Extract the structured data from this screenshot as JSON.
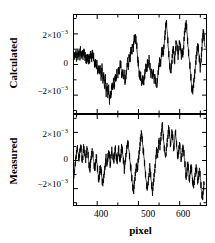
{
  "figure": {
    "background": "#ffffff",
    "foreground": "#000000",
    "xlabel": "pixel",
    "panels": [
      {
        "id": "calculated",
        "ylabel": "Calculated"
      },
      {
        "id": "measured",
        "ylabel": "Measured"
      }
    ],
    "ytick_labels": [
      "2×10",
      "0",
      "−2×10"
    ],
    "ytick_exponent": "−3",
    "xtick_labels": [
      "400",
      "500",
      "600"
    ]
  },
  "chart_data": {
    "type": "line",
    "title": "",
    "subtitle": "",
    "xlabel": "pixel",
    "ylabel": "",
    "grid": false,
    "legend": null,
    "xlim": [
      345,
      665
    ],
    "xticks": [
      400,
      500,
      600
    ],
    "xticks_minor": [
      350,
      450,
      550,
      650
    ],
    "xtick_labels": [
      "400",
      "500",
      "600"
    ],
    "shared_x": true,
    "panels": [
      {
        "name": "Calculated",
        "ylabel": "Calculated",
        "ylim": [
          -0.0032,
          0.0032
        ],
        "yticks": [
          0.002,
          0,
          -0.002
        ],
        "ytick_labels": [
          "2×10⁻³",
          "0",
          "−2×10⁻³"
        ],
        "line_color": "#000000",
        "line_width": 0.8,
        "x": [
          345,
          347,
          349,
          351,
          353,
          355,
          357,
          359,
          361,
          363,
          365,
          367,
          369,
          371,
          373,
          375,
          377,
          379,
          381,
          383,
          385,
          387,
          389,
          391,
          393,
          395,
          397,
          399,
          401,
          403,
          405,
          407,
          409,
          411,
          413,
          415,
          417,
          419,
          421,
          423,
          425,
          427,
          429,
          431,
          433,
          435,
          437,
          439,
          441,
          443,
          445,
          447,
          449,
          451,
          453,
          455,
          457,
          459,
          461,
          463,
          465,
          467,
          469,
          471,
          473,
          475,
          477,
          479,
          481,
          483,
          485,
          487,
          489,
          491,
          493,
          495,
          497,
          499,
          501,
          503,
          505,
          507,
          509,
          511,
          513,
          515,
          517,
          519,
          521,
          523,
          525,
          527,
          529,
          531,
          533,
          535,
          537,
          539,
          541,
          543,
          545,
          547,
          549,
          551,
          553,
          555,
          557,
          559,
          561,
          563,
          565,
          567,
          569,
          571,
          573,
          575,
          577,
          579,
          581,
          583,
          585,
          587,
          589,
          591,
          593,
          595,
          597,
          599,
          601,
          603,
          605,
          607,
          609,
          611,
          613,
          615,
          617,
          619,
          621,
          623,
          625,
          627,
          629,
          631,
          633,
          635,
          637,
          639,
          641,
          643,
          645,
          647,
          649,
          651,
          653,
          655,
          657,
          659,
          661,
          663
        ],
        "y": [
          0.00055,
          0.0004,
          0.00062,
          0.00038,
          0.0007,
          0.00045,
          0.00085,
          0.00052,
          0.00098,
          0.0006,
          0.00088,
          0.00035,
          0.00075,
          0.0003,
          0.0006,
          0.00018,
          0.0005,
          8e-05,
          0.00062,
          0.0003,
          0.00078,
          0.00042,
          0.0007,
          0.00025,
          0.0004,
          -0.0001,
          0.0002,
          -0.0003,
          5e-05,
          -0.00045,
          -0.00015,
          -0.00055,
          -0.0002,
          -0.0008,
          -0.0004,
          -0.0011,
          -0.0007,
          -0.00155,
          -0.001,
          -0.0019,
          -0.0013,
          -0.00215,
          -0.0016,
          -0.0023,
          -0.00175,
          -0.00205,
          -0.0014,
          -0.0017,
          -0.00105,
          -0.0014,
          -0.00075,
          -0.00105,
          -0.0004,
          -0.00075,
          -0.00018,
          -0.0005,
          8e-05,
          -0.0003,
          -0.00085,
          -0.0005,
          -0.00105,
          -0.00062,
          -0.0012,
          -0.00065,
          -0.00025,
          0.0003,
          -0.0001,
          0.00055,
          0.00025,
          0.0009,
          0.0006,
          0.00135,
          0.001,
          0.0018,
          0.00145,
          0.002,
          0.0013,
          0.0006,
          -0.0001,
          -0.0006,
          -0.0011,
          -0.00075,
          -0.00125,
          -0.00085,
          -0.00135,
          -0.0009,
          -0.0005,
          0.0,
          -0.0004,
          0.0001,
          -0.0003,
          0.0002,
          -0.00015,
          -0.0007,
          -0.0003,
          -0.00085,
          -0.00045,
          -0.001,
          -0.00055,
          -0.0011,
          -0.0016,
          -0.00115,
          -0.00065,
          -0.0002,
          0.00035,
          0.0,
          0.0006,
          0.0011,
          0.0006,
          0.00125,
          0.0018,
          0.0023,
          0.0027,
          0.002,
          0.0012,
          0.00055,
          -5e-05,
          -0.0006,
          -0.0002,
          0.00045,
          0.0011,
          0.00075,
          0.0002,
          0.00085,
          0.0015,
          0.001,
          0.0004,
          0.00095,
          0.0016,
          0.00115,
          0.0005,
          0.0011,
          0.0006,
          0.0013,
          0.0019,
          0.0024,
          0.0027,
          0.002,
          0.0013,
          0.00075,
          0.0002,
          -0.0004,
          -0.00095,
          -0.0015,
          -0.00195,
          -0.0014,
          -0.00085,
          -0.0003,
          0.00025,
          0.0008,
          0.0013,
          0.0008,
          0.0003,
          -0.0002,
          0.0004,
          0.001,
          0.0016,
          0.00215,
          0.0015,
          0.00085,
          0.0011
        ]
      },
      {
        "name": "Measured",
        "ylabel": "Measured",
        "ylim": [
          -0.0032,
          0.0032
        ],
        "yticks": [
          0.002,
          0,
          -0.002
        ],
        "ytick_labels": [
          "2×10⁻³",
          "0",
          "−2×10⁻³"
        ],
        "line_color": "#000000",
        "line_width": 0.8,
        "x": [
          345,
          347,
          349,
          351,
          353,
          355,
          357,
          359,
          361,
          363,
          365,
          367,
          369,
          371,
          373,
          375,
          377,
          379,
          381,
          383,
          385,
          387,
          389,
          391,
          393,
          395,
          397,
          399,
          401,
          403,
          405,
          407,
          409,
          411,
          413,
          415,
          417,
          419,
          421,
          423,
          425,
          427,
          429,
          431,
          433,
          435,
          437,
          439,
          441,
          443,
          445,
          447,
          449,
          451,
          453,
          455,
          457,
          459,
          461,
          463,
          465,
          467,
          469,
          471,
          473,
          475,
          477,
          479,
          481,
          483,
          485,
          487,
          489,
          491,
          493,
          495,
          497,
          499,
          501,
          503,
          505,
          507,
          509,
          511,
          513,
          515,
          517,
          519,
          521,
          523,
          525,
          527,
          529,
          531,
          533,
          535,
          537,
          539,
          541,
          543,
          545,
          547,
          549,
          551,
          553,
          555,
          557,
          559,
          561,
          563,
          565,
          567,
          569,
          571,
          573,
          575,
          577,
          579,
          581,
          583,
          585,
          587,
          589,
          591,
          593,
          595,
          597,
          599,
          601,
          603,
          605,
          607,
          609,
          611,
          613,
          615,
          617,
          619,
          621,
          623,
          625,
          627,
          629,
          631,
          633,
          635,
          637,
          639,
          641,
          643,
          645,
          647,
          649,
          651,
          653,
          655,
          657,
          659,
          661,
          663
        ],
        "y": [
          -0.0011,
          -0.0006,
          -0.0001,
          0.0004,
          0.0009,
          0.0005,
          0.0,
          0.0006,
          0.00105,
          0.00055,
          0.0,
          0.0005,
          0.001,
          0.00045,
          -0.0001,
          0.00045,
          0.00095,
          0.0004,
          -0.00015,
          -0.0007,
          -0.0002,
          0.00035,
          0.00085,
          0.0003,
          -0.00025,
          -0.0008,
          -0.00035,
          0.0002,
          -0.00035,
          -0.0009,
          -0.0014,
          -0.0009,
          -0.00035,
          -0.0009,
          -0.00145,
          -0.0019,
          -0.00135,
          -0.0008,
          -0.0003,
          0.0002,
          -0.0003,
          0.0002,
          0.0007,
          0.0002,
          -0.0003,
          0.00025,
          0.00075,
          0.0003,
          -0.0002,
          0.0003,
          0.0008,
          0.00035,
          -0.00015,
          0.00035,
          0.0009,
          0.0004,
          -0.0001,
          0.0004,
          0.00095,
          0.00045,
          -0.0001,
          -0.00065,
          -0.00015,
          0.00035,
          0.0009,
          0.0014,
          0.0009,
          0.00035,
          -0.0002,
          -0.00075,
          -0.0013,
          -0.0018,
          -0.0023,
          -0.00175,
          -0.0012,
          -0.00065,
          -0.0001,
          -0.00065,
          -0.0001,
          0.00045,
          0.001,
          0.00155,
          0.00195,
          0.0013,
          0.0007,
          0.0001,
          -0.0005,
          -0.0011,
          -0.00165,
          -0.00215,
          -0.0016,
          -0.00105,
          -0.0005,
          -0.00115,
          -0.00175,
          -0.0023,
          -0.00175,
          -0.00115,
          -0.00055,
          5e-05,
          0.00065,
          0.0001,
          0.0007,
          0.0013,
          0.0008,
          0.0014,
          0.002,
          0.00255,
          0.0019,
          0.00125,
          0.00065,
          5e-05,
          0.00065,
          0.00125,
          0.0018,
          0.0023,
          0.0017,
          0.0011,
          0.0016,
          0.0021,
          0.0015,
          0.0009,
          0.0014,
          0.0019,
          0.0013,
          0.0007,
          0.0001,
          0.00065,
          0.0012,
          0.0006,
          0.0,
          0.00055,
          0.0011,
          0.0005,
          -0.0001,
          -0.0007,
          -0.0013,
          -0.00075,
          -0.0002,
          -0.0008,
          -0.0014,
          -0.00085,
          -0.0003,
          -0.0009,
          -0.0015,
          -0.00205,
          -0.0015,
          -0.00095,
          -0.0004,
          -0.001,
          -0.0016,
          -0.0011,
          -0.00055,
          -0.00115,
          -0.00175,
          -0.0023,
          -0.00275,
          -0.0021,
          -0.0015
        ]
      }
    ]
  }
}
